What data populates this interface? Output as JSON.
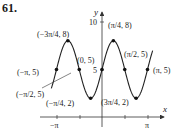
{
  "problem_number": "61.",
  "axes": {
    "x_label": "x",
    "y_label": "y",
    "x_ticks": [
      "−π",
      "π"
    ],
    "y_ticks": [
      "5",
      "10"
    ]
  },
  "curve": "y = 5 + 3 sin(2x)",
  "points": [
    {
      "label": "(−π, 5)",
      "x": -3.14159,
      "y": 5
    },
    {
      "label": "(−3π/4, 8)",
      "x": -2.35619,
      "y": 8
    },
    {
      "label": "(−π/2, 5)",
      "x": -1.5708,
      "y": 5
    },
    {
      "label": "(−π/4, 2)",
      "x": -0.7854,
      "y": 2
    },
    {
      "label": "(0, 5)",
      "x": 0,
      "y": 5
    },
    {
      "label": "(π/4, 8)",
      "x": 0.7854,
      "y": 8
    },
    {
      "label": "(π/2, 5)",
      "x": 1.5708,
      "y": 5
    },
    {
      "label": "(3π/4, 2)",
      "x": 2.35619,
      "y": 2
    },
    {
      "label": "(π, 5)",
      "x": 3.14159,
      "y": 5
    }
  ],
  "colors": {
    "curve": "#222222",
    "axis": "#333333"
  }
}
